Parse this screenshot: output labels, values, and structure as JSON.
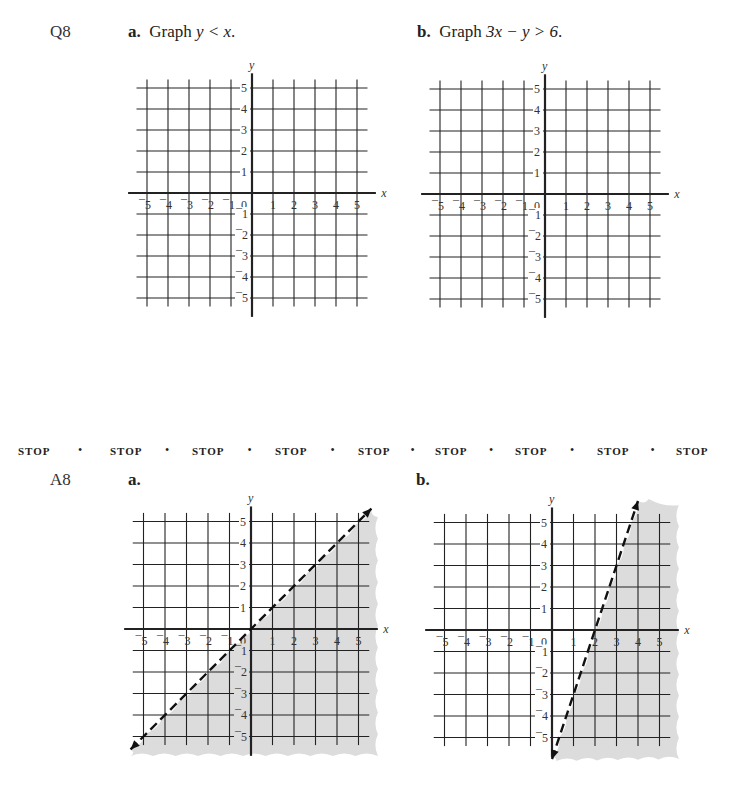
{
  "question": {
    "number": "Q8",
    "part_a": {
      "letter": "a.",
      "prefix": "Graph ",
      "expression": "y < x",
      "suffix": "."
    },
    "part_b": {
      "letter": "b.",
      "prefix": "Graph ",
      "expression": "3x − y > 6",
      "suffix": "."
    }
  },
  "stop_bar": {
    "label": "STOP",
    "separator": "•",
    "count": 9
  },
  "answer": {
    "number": "A8",
    "part_a": {
      "letter": "a."
    },
    "part_b": {
      "letter": "b."
    }
  },
  "axes": {
    "x_label": "x",
    "y_label": "y",
    "origin_label": "0",
    "x_ticks": [
      "¯5",
      "¯4",
      "¯3",
      "¯2",
      "¯1",
      "1",
      "2",
      "3",
      "4",
      "5"
    ],
    "y_ticks_pos": [
      "1",
      "2",
      "3",
      "4",
      "5"
    ],
    "y_ticks_neg": [
      "¯1",
      "¯2",
      "¯3",
      "¯4",
      "¯5"
    ]
  },
  "chart_data": [
    {
      "type": "line",
      "title": "Graph y < x (blank grid)",
      "xlabel": "x",
      "ylabel": "y",
      "xlim": [
        -5,
        5
      ],
      "ylim": [
        -5,
        5
      ],
      "grid": true,
      "series": []
    },
    {
      "type": "line",
      "title": "Graph 3x − y > 6 (blank grid)",
      "xlabel": "x",
      "ylabel": "y",
      "xlim": [
        -5,
        5
      ],
      "ylim": [
        -5,
        5
      ],
      "grid": true,
      "series": []
    },
    {
      "type": "area",
      "title": "A8 a. y < x",
      "xlabel": "x",
      "ylabel": "y",
      "xlim": [
        -5,
        5
      ],
      "ylim": [
        -5,
        5
      ],
      "grid": true,
      "series": [
        {
          "name": "boundary y = x (dashed)",
          "x": [
            -5.5,
            5.5
          ],
          "y": [
            -5.5,
            5.5
          ],
          "style": "dashed"
        },
        {
          "name": "shaded region",
          "description": "below the line y = x"
        }
      ]
    },
    {
      "type": "area",
      "title": "A8 b. 3x − y > 6",
      "xlabel": "x",
      "ylabel": "y",
      "xlim": [
        -5,
        5
      ],
      "ylim": [
        -5,
        5
      ],
      "grid": true,
      "series": [
        {
          "name": "boundary y = 3x − 6 (dashed)",
          "x": [
            0,
            4
          ],
          "y": [
            -6,
            6
          ],
          "style": "dashed"
        },
        {
          "name": "shaded region",
          "description": "below/right of the line y = 3x − 6"
        }
      ]
    }
  ],
  "colors": {
    "grid": "#222222",
    "shade": "#dcdcdc",
    "text": "#222222"
  }
}
